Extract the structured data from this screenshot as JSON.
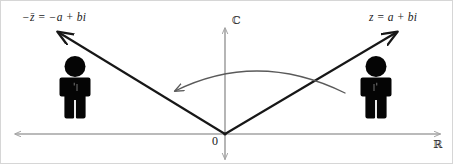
{
  "figure": {
    "width": 453,
    "height": 164,
    "background_color": "#ffffff",
    "border_color": "#d6d6d6"
  },
  "labels": {
    "left_point": "−z̄ = −a + bi",
    "right_point": "z = a + bi",
    "imaginary_axis": "ℂ",
    "real_axis": "ℝ",
    "origin": "0"
  },
  "colors": {
    "axis": "#a3a3a3",
    "vector": "#171717",
    "arc": "#5a5a5a",
    "figure_silhouette": "#050505",
    "text": "#1a1a1a"
  },
  "geometry": {
    "origin": {
      "x": 224,
      "y": 133
    },
    "real_axis": {
      "x1": 13,
      "y1": 133,
      "x2": 440,
      "y2": 133
    },
    "imaginary_axis": {
      "x1": 224,
      "y1": 26,
      "x2": 224,
      "y2": 160
    },
    "vector_right": {
      "x1": 224,
      "y1": 133,
      "x2": 399,
      "y2": 29
    },
    "vector_left": {
      "x1": 224,
      "y1": 133,
      "x2": 54,
      "y2": 29
    },
    "arc": {
      "start_x": 344,
      "start_y": 92,
      "end_x": 170,
      "end_y": 92,
      "apex_y": 66
    }
  },
  "people": [
    {
      "name": "person-left",
      "x": 74,
      "y": 96,
      "scale": 1.0
    },
    {
      "name": "person-right",
      "x": 375,
      "y": 96,
      "scale": 1.0
    }
  ]
}
